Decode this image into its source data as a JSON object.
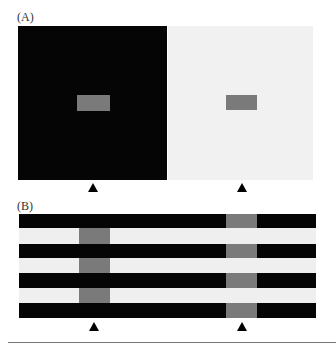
{
  "panel_a": {
    "label": "(A)",
    "left_square": {
      "color": "#050505",
      "patch_color": "#7a7a7a"
    },
    "right_square": {
      "color": "#f1f1f1",
      "patch_color": "#7a7a7a"
    },
    "markers": [
      "triangle-up",
      "triangle-up"
    ]
  },
  "panel_b": {
    "label": "(B)",
    "stripes": [
      "dark",
      "light",
      "dark",
      "light",
      "dark",
      "light",
      "dark"
    ],
    "left_gray_column_on": "light stripes",
    "right_gray_column_on": "dark stripes",
    "patch_color": "#7a7a7a",
    "markers": [
      "triangle-up",
      "triangle-up"
    ]
  }
}
